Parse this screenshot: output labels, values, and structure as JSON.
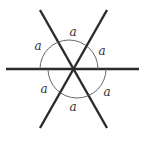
{
  "diagram": {
    "line_color": "#2b2b2b",
    "arc_color": "#555555",
    "label_color": "#333333",
    "center": [
      73,
      69
    ],
    "lines": [
      {
        "name": "horizontal",
        "x1": 6,
        "y1": 69,
        "x2": 139,
        "y2": 69
      },
      {
        "name": "diagonal-1",
        "x1": 40,
        "y1": 10,
        "x2": 107,
        "y2": 128
      },
      {
        "name": "diagonal-2",
        "x1": 107,
        "y1": 10,
        "x2": 40,
        "y2": 128
      }
    ],
    "arcs": [
      {
        "name": "upper-arc",
        "cx": 69,
        "cy": 69,
        "r": 29
      },
      {
        "name": "lower-arc",
        "cx": 77,
        "cy": 69,
        "r": 29
      }
    ],
    "angle_labels": [
      {
        "text": "a",
        "x": 73,
        "y": 36
      },
      {
        "text": "a",
        "x": 38,
        "y": 50
      },
      {
        "text": "a",
        "x": 102,
        "y": 55
      },
      {
        "text": "a",
        "x": 44,
        "y": 93
      },
      {
        "text": "a",
        "x": 107,
        "y": 96
      },
      {
        "text": "a",
        "x": 73,
        "y": 111
      }
    ]
  }
}
